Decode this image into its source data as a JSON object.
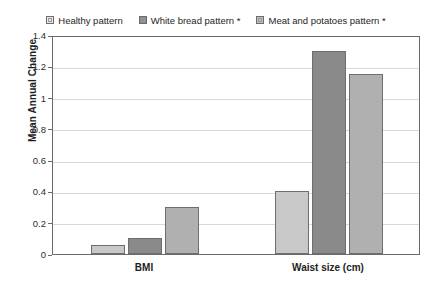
{
  "chart_data": {
    "type": "bar",
    "title": "",
    "subtitle": "",
    "xlabel": "",
    "ylabel": "Mean Annual Change",
    "ylim": [
      0,
      1.4
    ],
    "ytick_labels": [
      "1.4",
      "1.2",
      "1",
      "0.8",
      "0.6",
      "0.4",
      "0.2",
      "0"
    ],
    "ytick_values": [
      1.4,
      1.2,
      1.0,
      0.8,
      0.6,
      0.4,
      0.2,
      0
    ],
    "grid": true,
    "legend_position": "top-center",
    "categories": [
      "BMI",
      "Waist size (cm)"
    ],
    "series": [
      {
        "name": "Healthy pattern",
        "color": "#c8c8c8",
        "values": [
          0.06,
          0.4
        ]
      },
      {
        "name": "White bread pattern *",
        "color": "#8a8a8a",
        "values": [
          0.1,
          1.3
        ]
      },
      {
        "name": "Meat and potatoes pattern *",
        "color": "#b0b0b0",
        "values": [
          0.3,
          1.15
        ]
      }
    ],
    "annotations": [
      "* denotes statistical significance marker shown in legend labels"
    ]
  },
  "legend": {
    "items": [
      {
        "label": "Healthy pattern",
        "swatch_color": "#e8e8e8"
      },
      {
        "label": "White bread pattern *",
        "swatch_color": "#8a8a8a"
      },
      {
        "label": "Meat and potatoes pattern *",
        "swatch_color": "#c0c0c0"
      }
    ]
  },
  "axes": {
    "y_title": "Mean Annual Change",
    "y_ticks": [
      "1.4",
      "1.2",
      "1",
      "0.8",
      "0.6",
      "0.4",
      "0.2",
      "0"
    ],
    "x_categories": [
      "BMI",
      "Waist size (cm)"
    ]
  },
  "colors": {
    "frame": "#6a6a6a",
    "gridline": "#d8d8d8",
    "bar_border": "#6e6e6e",
    "background": "#ffffff"
  }
}
